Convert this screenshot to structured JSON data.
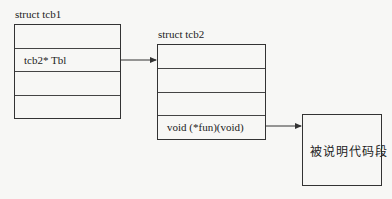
{
  "struct1": {
    "title": "struct  tcb1",
    "rows": [
      "",
      "tcb2* Tbl",
      "",
      ""
    ]
  },
  "struct2": {
    "title": "struct  tcb2",
    "rows": [
      "",
      "",
      "",
      "void (*fun)(void)"
    ]
  },
  "code_block": {
    "label": "被说明代码段"
  }
}
